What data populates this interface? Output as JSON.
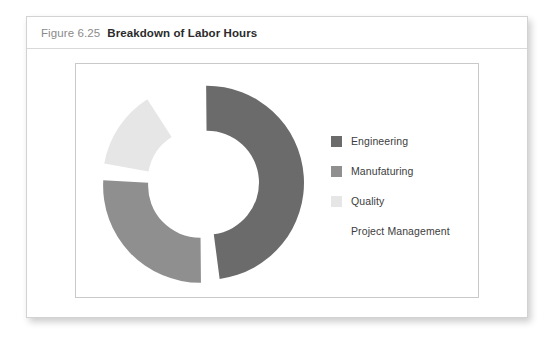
{
  "figure": {
    "number": "Figure 6.25",
    "caption": "Breakdown of Labor Hours"
  },
  "colors": {
    "engineering": "#6b6b6b",
    "manufaturing": "#8f8f8f",
    "quality": "#e6e6e6",
    "project_management": "#ffffff",
    "card_border": "#d2d2d2",
    "plot_border": "#c9c9c9",
    "title_rule": "#d9d9d9",
    "figure_number_text": "#8a8a8a",
    "caption_text": "#2b2b2b",
    "legend_text": "#3d3d3d"
  },
  "legend": {
    "items": [
      {
        "label": "Engineering",
        "color": "#6b6b6b",
        "swatch_visible": true
      },
      {
        "label": "Manufaturing",
        "color": "#8f8f8f",
        "swatch_visible": true
      },
      {
        "label": "Quality",
        "color": "#e6e6e6",
        "swatch_visible": true
      },
      {
        "label": "Project Management",
        "color": "#ffffff",
        "swatch_visible": false
      }
    ]
  },
  "chart_data": {
    "type": "pie",
    "variant": "doughnut-exploded",
    "title": "Breakdown of Labor Hours",
    "categories": [
      "Engineering",
      "Manufaturing",
      "Quality",
      "Project Management"
    ],
    "values": [
      50,
      28,
      15,
      7
    ],
    "unit": "percent of labor hours",
    "colors": [
      "#6b6b6b",
      "#8f8f8f",
      "#e6e6e6",
      "#ffffff"
    ],
    "legend_position": "right",
    "data_labels": false,
    "grid": false,
    "geometry": {
      "center_x": 115,
      "center_y": 117,
      "outer_radius": 97,
      "inner_radius": 52,
      "start_angle_deg": -4,
      "gap_deg": 7,
      "explode_offset": 4
    }
  }
}
